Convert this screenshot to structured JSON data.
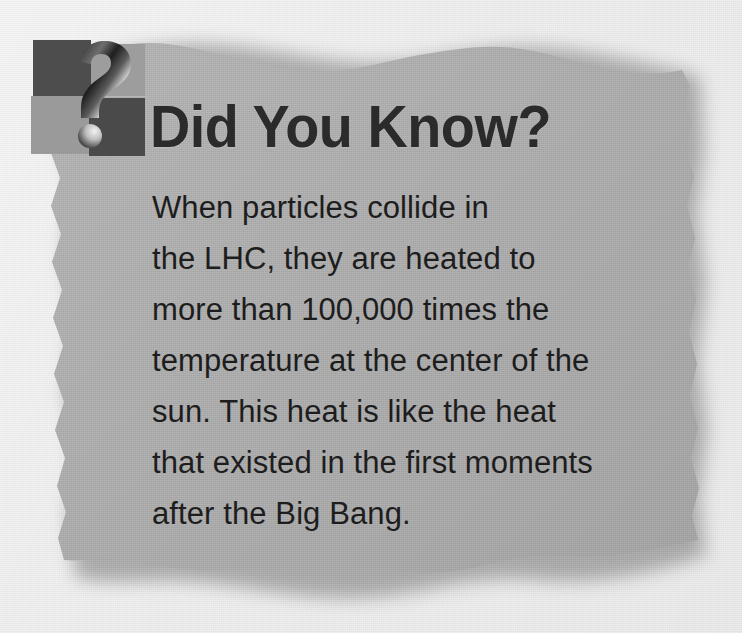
{
  "card": {
    "title": "Did You Know?",
    "icon_name": "question-mark-badge-icon",
    "body_lines": [
      "When particles collide in",
      "the LHC, they are heated to",
      "more than 100,000 times the",
      "temperature at the center of the",
      "sun. This heat is like the heat",
      "that existed in the first moments",
      "after the Big Bang."
    ],
    "body_text": "When particles collide in the LHC, they are heated to more than 100,000 times the temperature at the center of the sun. This heat is like the heat that existed in the first moments after the Big Bang.",
    "colors": {
      "page_background": "#efefef",
      "panel_fill": "#a9a9a9",
      "panel_shadow": "#6f6f6f",
      "title_text": "#2b2b2b",
      "body_text": "#1d1d1d",
      "badge_square_dark": "#4d4d4d",
      "badge_square_light": "#9d9d9d",
      "question_mark_highlight": "#e8e8e8",
      "question_mark_shadow": "#2a2a2a"
    }
  }
}
